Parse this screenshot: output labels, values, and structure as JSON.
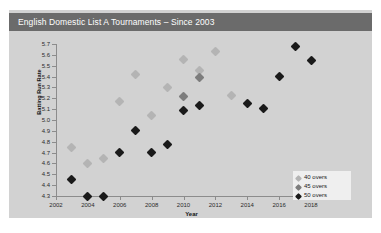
{
  "title": "English Domestic List A Tournaments – Since 2003",
  "colors": {
    "card_bg": "#d2d2d2",
    "title_bar": "#6b6b6b",
    "title_text": "#ffffff",
    "overs_40": "#b4b4b4",
    "overs_45": "#7d7d7d",
    "overs_50": "#1a1a1a",
    "axis": "#8c8c8c",
    "legend_bg": "#efefef"
  },
  "legend": {
    "position": "bottom-right",
    "items": [
      {
        "label": "40 overs",
        "color": "#b4b4b4"
      },
      {
        "label": "45 overs",
        "color": "#7d7d7d"
      },
      {
        "label": "50 overs",
        "color": "#1a1a1a"
      }
    ]
  },
  "axes": {
    "xlabel": "Year",
    "ylabel": "Batting Run Rate",
    "xticks": [
      "2002",
      "2004",
      "2006",
      "2008",
      "2010",
      "2012",
      "2014",
      "2016",
      "2018"
    ],
    "yticks": [
      "5.7",
      "5.6",
      "5.5",
      "5.4",
      "5.3",
      "5.2",
      "5.1",
      "5.0",
      "4.9",
      "4.8",
      "4.7",
      "4.6",
      "4.5",
      "4.4",
      "4.3"
    ]
  },
  "chart_data": {
    "type": "scatter",
    "title": "English Domestic List A Tournaments – Since 2003",
    "xlabel": "Year",
    "ylabel": "Batting Run Rate",
    "xlim": [
      2002,
      2019
    ],
    "ylim": [
      4.3,
      5.7
    ],
    "grid": false,
    "legend_position": "bottom-right",
    "marker": "diamond",
    "series": [
      {
        "name": "40 overs",
        "color": "#b4b4b4",
        "points": [
          {
            "x": 2003,
            "y": 4.75
          },
          {
            "x": 2004,
            "y": 4.6
          },
          {
            "x": 2005,
            "y": 4.65
          },
          {
            "x": 2006,
            "y": 5.17
          },
          {
            "x": 2007,
            "y": 5.42
          },
          {
            "x": 2008,
            "y": 5.04
          },
          {
            "x": 2009,
            "y": 5.3
          },
          {
            "x": 2010,
            "y": 5.56
          },
          {
            "x": 2011,
            "y": 5.46
          },
          {
            "x": 2012,
            "y": 5.63
          },
          {
            "x": 2013,
            "y": 5.23
          }
        ]
      },
      {
        "name": "45 overs",
        "color": "#7d7d7d",
        "points": [
          {
            "x": 2010,
            "y": 5.22
          },
          {
            "x": 2011,
            "y": 5.39
          }
        ]
      },
      {
        "name": "50 overs",
        "color": "#1a1a1a",
        "points": [
          {
            "x": 2003,
            "y": 4.45
          },
          {
            "x": 2004,
            "y": 4.3
          },
          {
            "x": 2005,
            "y": 4.3
          },
          {
            "x": 2006,
            "y": 4.7
          },
          {
            "x": 2007,
            "y": 4.9
          },
          {
            "x": 2008,
            "y": 4.7
          },
          {
            "x": 2009,
            "y": 4.77
          },
          {
            "x": 2010,
            "y": 5.09
          },
          {
            "x": 2011,
            "y": 5.13
          },
          {
            "x": 2014,
            "y": 5.15
          },
          {
            "x": 2015,
            "y": 5.11
          },
          {
            "x": 2016,
            "y": 5.4
          },
          {
            "x": 2017,
            "y": 5.68
          },
          {
            "x": 2018,
            "y": 5.55
          }
        ]
      }
    ]
  }
}
